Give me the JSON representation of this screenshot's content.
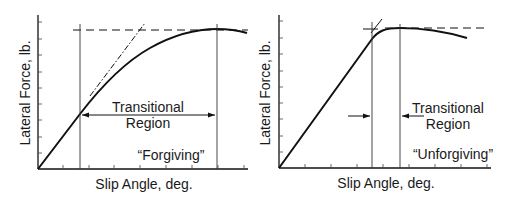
{
  "charts": [
    {
      "id": "forgiving",
      "ylabel": "Lateral Force, lb.",
      "xlabel": "Slip Angle, deg.",
      "region_label_line1": "Transitional",
      "region_label_line2": "Region",
      "characterization": "“Forgiving”"
    },
    {
      "id": "unforgiving",
      "ylabel": "Lateral Force, lb.",
      "xlabel": "Slip Angle, deg.",
      "region_label_line1": "Transitional",
      "region_label_line2": "Region",
      "characterization": "“Unforgiving”"
    }
  ],
  "colors": {
    "ink": "#111111",
    "background": "#ffffff"
  }
}
